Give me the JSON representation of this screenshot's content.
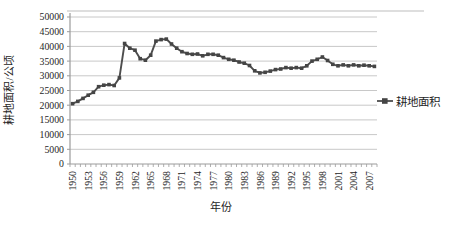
{
  "chart_data": {
    "type": "line",
    "title": "",
    "xlabel": "年份",
    "ylabel": "耕地面积/公顷",
    "ylim": [
      0,
      50000
    ],
    "y_tick_step": 5000,
    "y_tick_labels": [
      "50000",
      "45000",
      "40000",
      "35000",
      "30000",
      "25000",
      "20000",
      "15000",
      "10000",
      "5000",
      "0"
    ],
    "x_tick_labels": [
      "1950",
      "1953",
      "1956",
      "1959",
      "1962",
      "1965",
      "1968",
      "1971",
      "1974",
      "1977",
      "1980",
      "1983",
      "1986",
      "1989",
      "1992",
      "1995",
      "1998",
      "2001",
      "2004",
      "2007"
    ],
    "x": [
      1950,
      1951,
      1952,
      1953,
      1954,
      1955,
      1956,
      1957,
      1958,
      1959,
      1960,
      1961,
      1962,
      1963,
      1964,
      1965,
      1966,
      1967,
      1968,
      1969,
      1970,
      1971,
      1972,
      1973,
      1974,
      1975,
      1976,
      1977,
      1978,
      1979,
      1980,
      1981,
      1982,
      1983,
      1984,
      1985,
      1986,
      1987,
      1988,
      1989,
      1990,
      1991,
      1992,
      1993,
      1994,
      1995,
      1996,
      1997,
      1998,
      1999,
      2000,
      2001,
      2002,
      2003,
      2004,
      2005,
      2006,
      2007,
      2008
    ],
    "series": [
      {
        "name": "耕地面积",
        "marker": "square",
        "values": [
          20500,
          21300,
          22300,
          23400,
          24400,
          26300,
          26800,
          27000,
          26700,
          29300,
          41000,
          39400,
          38700,
          35800,
          35300,
          37000,
          41800,
          42300,
          42500,
          40800,
          39400,
          38200,
          37600,
          37300,
          37400,
          36800,
          37300,
          37300,
          37000,
          36200,
          35600,
          35300,
          34700,
          34300,
          33500,
          31700,
          31000,
          31200,
          31600,
          32100,
          32300,
          32800,
          32600,
          32800,
          32600,
          33400,
          35000,
          35600,
          36400,
          35200,
          33900,
          33400,
          33700,
          33400,
          33700,
          33400,
          33600,
          33400,
          33200
        ]
      }
    ],
    "grid": "horizontal",
    "legend_position": "right-middle",
    "colors": {
      "line": "#4d4d4d",
      "marker": "#454545",
      "grid": "#c8c8c8",
      "axis": "#9b9b9b",
      "text": "#262626",
      "top_rule": "#bdbdbd",
      "background": "#ffffff"
    }
  }
}
